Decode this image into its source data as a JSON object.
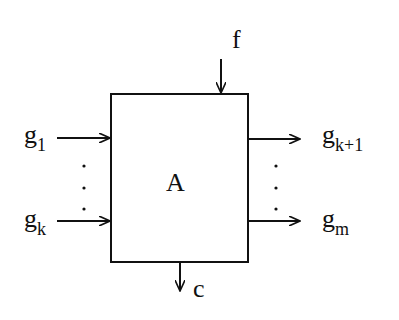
{
  "block": {
    "label": "A"
  },
  "inputs": [
    {
      "base": "g",
      "sub": "1"
    },
    {
      "base": "g",
      "sub": "k"
    }
  ],
  "outputs": [
    {
      "base": "g",
      "sub": "k+1"
    },
    {
      "base": "g",
      "sub": "m"
    }
  ],
  "top_input": {
    "label": "f"
  },
  "bottom_output": {
    "label": "c"
  },
  "ellipsis": "⋮"
}
